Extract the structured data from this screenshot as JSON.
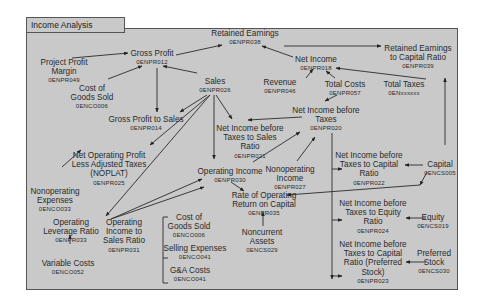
{
  "title": "Income Analysis",
  "nodes": {
    "retained_earnings": {
      "label": "Retained Earnings",
      "code": "0ENPR038"
    },
    "re_capital_ratio": {
      "label": "Retained Earnings\nto Capital Ratio",
      "code": "0ENPR039"
    },
    "gross_profit": {
      "label": "Gross Profit",
      "code": "0ENPR012"
    },
    "project_profit_margin": {
      "label": "Project Profit\nMargin",
      "code": "0ENPR049"
    },
    "cogs_top": {
      "label": "Cost of\nGoods Sold",
      "code": "0ENCO006"
    },
    "sales": {
      "label": "Sales",
      "code": "0ENPR026"
    },
    "net_income": {
      "label": "Net Income",
      "code": "0ENPR018"
    },
    "revenue": {
      "label": "Revenue",
      "code": "0ENPR046"
    },
    "total_costs": {
      "label": "Total Costs",
      "code": "0ENPR057"
    },
    "total_taxes": {
      "label": "Total Taxes",
      "code": "0ENxxxxxx"
    },
    "gp_to_sales": {
      "label": "Gross Profit to Sales",
      "code": "0ENPR014"
    },
    "nibt": {
      "label": "Net Income before\nTaxes",
      "code": "0ENPR020"
    },
    "nibt_sales_ratio": {
      "label": "Net Income before\nTaxes to Sales\nRatio",
      "code": "0ENPR021"
    },
    "noplat": {
      "label": "Net Operating Profit\nLess Adjusted Taxes\n(NOPLAT)",
      "code": "0ENPR025"
    },
    "operating_income": {
      "label": "Operating Income",
      "code": "0ENPR030"
    },
    "nonop_income": {
      "label": "Nonoperating\nIncome",
      "code": "0ENPR027"
    },
    "nibt_capital_ratio": {
      "label": "Net Income before\nTaxes to Capital\nRatio",
      "code": "0ENPR022"
    },
    "capital": {
      "label": "Capital",
      "code": "0ENCS005"
    },
    "nonop_expenses": {
      "label": "Nonoperating\nExpenses",
      "code": "0ENCO033"
    },
    "op_leverage": {
      "label": "Operating\nLeverage Ratio",
      "code": "0ENPR033"
    },
    "op_income_sales": {
      "label": "Operating\nIncome to\nSales Ratio",
      "code": "0ENPR031"
    },
    "cogs_bottom": {
      "label": "Cost of\nGoods Sold",
      "code": "0ENCO006"
    },
    "selling_exp": {
      "label": "Selling Expenses",
      "code": "0ENCO041"
    },
    "ga_costs": {
      "label": "G&A Costs",
      "code": "0ENCO041"
    },
    "rorc": {
      "label": "Rate of Operating\nReturn on Capital",
      "code": "0ENPR035"
    },
    "noncurrent_assets": {
      "label": "Noncurrent\nAssets",
      "code": "0ENCS029"
    },
    "nibt_equity": {
      "label": "Net Income before\nTaxes to Equity\nRatio",
      "code": "0ENPR024"
    },
    "equity": {
      "label": "Equity",
      "code": "0ENCS019"
    },
    "variable_costs": {
      "label": "Variable Costs",
      "code": "0ENCO052"
    },
    "nibt_pref": {
      "label": "Net Income before\nTaxes to Capital\nRatio (Preferred\nStock)",
      "code": "0ENPR023"
    },
    "preferred_stock": {
      "label": "Preferred\nStock",
      "code": "0ENCS030"
    }
  }
}
